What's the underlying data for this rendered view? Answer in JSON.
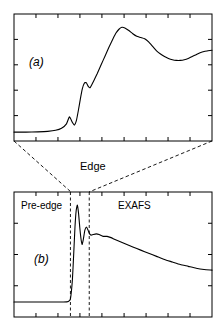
{
  "figure": {
    "title": "",
    "labels": {
      "panel_a": "(a)",
      "panel_b": "(b)",
      "edge": "Edge",
      "pre_edge": "Pre-edge",
      "exafs": "EXAFS"
    },
    "colors": {
      "line": "#000000",
      "axis": "#000000",
      "dashed": "#000000",
      "background": "#ffffff"
    }
  },
  "chart_data": [
    {
      "type": "line",
      "id": "panel-a-xanes",
      "title": "(a)",
      "xlabel": "",
      "ylabel": "",
      "xlim": [
        0,
        100
      ],
      "ylim": [
        0,
        100
      ],
      "grid": false,
      "legend": null,
      "axis_ticks": {
        "x_top": [
          11.1,
          22.2,
          33.3,
          44.4,
          55.6,
          66.7,
          77.8,
          88.9
        ],
        "x_bottom": [
          11.1,
          22.2,
          33.3,
          44.4,
          55.6,
          66.7,
          77.8,
          88.9
        ],
        "y_left": [
          20,
          40,
          60,
          80
        ],
        "y_right": [
          20,
          40,
          60,
          80
        ],
        "tick_labels": []
      },
      "series": [
        {
          "name": "XANES (expanded edge region)",
          "x": [
            0.0,
            6.0,
            12.0,
            17.0,
            21.0,
            24.0,
            26.5,
            28.0,
            29.5,
            30.5,
            31.5,
            32.5,
            33.5,
            34.5,
            35.5,
            36.5,
            37.5,
            38.5,
            40.0,
            42.0,
            44.0,
            46.0,
            48.0,
            50.0,
            51.5,
            53.0,
            54.5,
            56.0,
            58.0,
            60.0,
            62.0,
            64.0,
            66.0,
            68.0,
            70.0,
            72.0,
            74.0,
            76.0,
            78.0,
            80.0,
            82.0,
            84.0,
            86.0,
            88.0,
            90.0,
            92.0,
            94.0,
            96.0,
            98.0,
            100.0
          ],
          "y": [
            7.0,
            7.0,
            7.2,
            7.6,
            8.4,
            10.0,
            13.5,
            19.0,
            14.5,
            12.5,
            16.0,
            24.0,
            33.0,
            41.0,
            45.5,
            46.0,
            43.0,
            42.0,
            46.5,
            53.0,
            60.0,
            67.0,
            74.0,
            80.5,
            85.0,
            88.0,
            89.5,
            89.0,
            87.0,
            84.5,
            82.5,
            81.5,
            80.5,
            78.0,
            74.5,
            71.0,
            68.5,
            66.5,
            65.0,
            64.0,
            63.5,
            63.5,
            64.0,
            65.0,
            66.5,
            68.0,
            69.5,
            70.5,
            71.0,
            71.5
          ]
        }
      ]
    },
    {
      "type": "line",
      "id": "panel-b-full-spectrum",
      "title": "(b)",
      "xlabel": "",
      "ylabel": "",
      "xlim": [
        0,
        100
      ],
      "ylim": [
        0,
        100
      ],
      "grid": false,
      "legend": null,
      "axis_ticks": {
        "x_top": [
          11.1,
          22.2,
          33.3,
          44.4,
          55.6,
          66.7,
          77.8,
          88.9
        ],
        "x_bottom": [
          11.1,
          22.2,
          33.3,
          44.4,
          55.6,
          66.7,
          77.8,
          88.9
        ],
        "y_left": [
          25,
          50,
          75
        ],
        "y_right": [
          25,
          50,
          75
        ],
        "tick_labels": []
      },
      "annotations": [
        {
          "text": "Pre-edge",
          "x": 6,
          "y": 88
        },
        {
          "text": "EXAFS",
          "x": 54,
          "y": 88
        },
        {
          "text": "(b)",
          "x": 14,
          "y": 48
        }
      ],
      "vlines": [
        {
          "x": 28.5,
          "style": "dashed",
          "label": "edge-start"
        },
        {
          "x": 38.0,
          "style": "dashed",
          "label": "edge-end"
        }
      ],
      "series": [
        {
          "name": "Full X-ray absorption spectrum",
          "x": [
            0.0,
            5.0,
            10.0,
            15.0,
            20.0,
            25.0,
            27.5,
            28.5,
            29.5,
            30.2,
            30.8,
            31.4,
            32.0,
            32.6,
            33.2,
            33.8,
            34.4,
            35.0,
            35.8,
            36.6,
            37.4,
            38.2,
            39.0,
            40.0,
            41.5,
            43.0,
            45.0,
            47.0,
            49.0,
            51.0,
            54.0,
            57.0,
            60.0,
            64.0,
            68.0,
            72.0,
            76.0,
            80.0,
            84.0,
            88.0,
            92.0,
            96.0,
            100.0
          ],
          "y": [
            12.0,
            12.0,
            12.0,
            12.0,
            12.0,
            12.0,
            12.5,
            14.5,
            30.0,
            52.0,
            72.0,
            85.0,
            89.5,
            83.0,
            72.0,
            63.0,
            58.0,
            62.0,
            69.5,
            72.0,
            69.5,
            66.5,
            65.5,
            66.0,
            66.5,
            66.0,
            64.5,
            64.5,
            63.5,
            62.0,
            60.0,
            58.0,
            56.0,
            53.5,
            51.0,
            48.5,
            46.0,
            44.0,
            42.0,
            40.5,
            39.0,
            38.0,
            37.5
          ]
        }
      ]
    }
  ],
  "connectors": [
    {
      "from": {
        "x": 14,
        "y": 141
      },
      "to": {
        "x": 71,
        "y": 192
      },
      "style": "dashed"
    },
    {
      "from": {
        "x": 212,
        "y": 141
      },
      "to": {
        "x": 89,
        "y": 192
      },
      "style": "dashed"
    }
  ]
}
